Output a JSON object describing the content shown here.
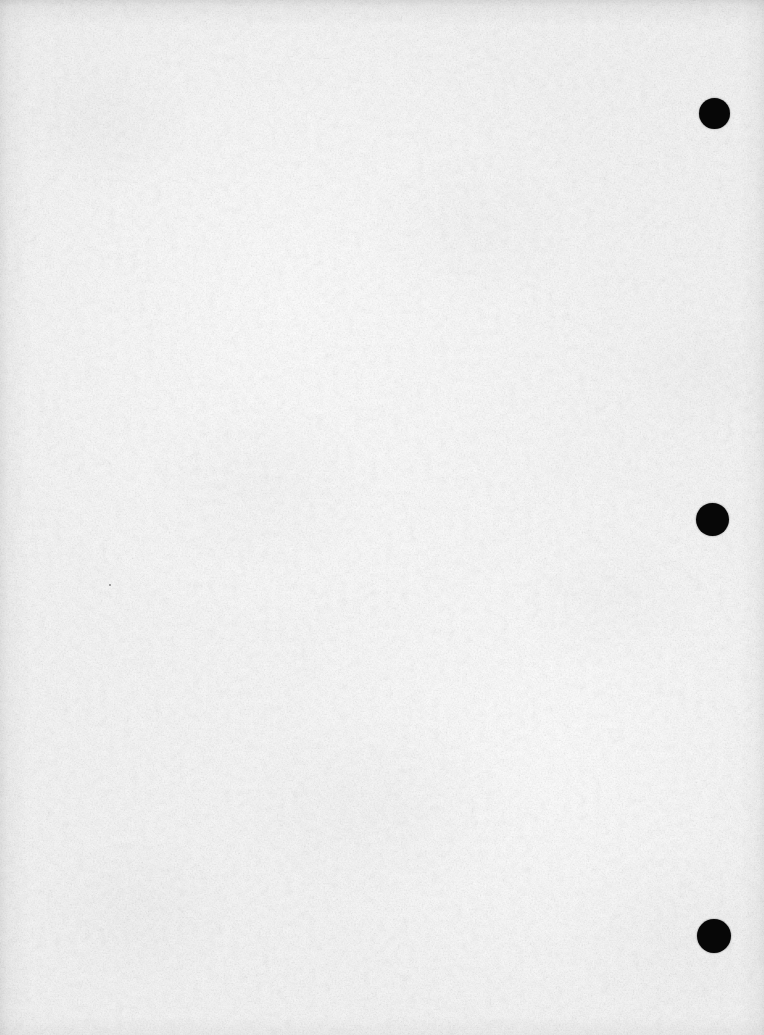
{
  "document": {
    "kind": "scanned-blank-page",
    "title": "Scanned Blank Page",
    "width": 764,
    "height": 1035,
    "text_content": "",
    "note": ""
  },
  "paper": {
    "background_color": "#f8f8f8",
    "highlight_color": "#ffffff",
    "shade_color": "#f5f5f5",
    "texture": "fibrous paper grain with soft mottling",
    "edge_shading": "faint dark bands along top, left and right edges"
  },
  "marks": {
    "color": "#070707",
    "kind": "punch-hole-registration-dots",
    "alignment": "vertical column near right edge",
    "count": 3,
    "items": [
      {
        "id": "punch-mark-top",
        "cx": 714,
        "cy": 113,
        "diameter": 31
      },
      {
        "id": "punch-mark-middle",
        "cx": 712,
        "cy": 519,
        "diameter": 33
      },
      {
        "id": "punch-mark-bottom",
        "cx": 714,
        "cy": 936,
        "diameter": 34
      }
    ]
  },
  "specks": {
    "items": [
      {
        "id": "scan-speck-1",
        "cx": 110,
        "cy": 585,
        "diameter": 2
      }
    ]
  }
}
